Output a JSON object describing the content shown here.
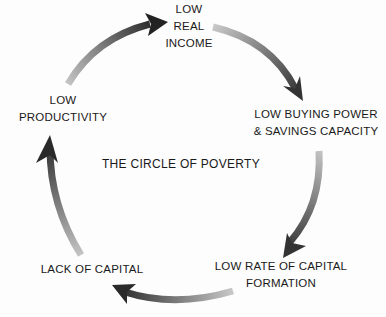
{
  "diagram": {
    "title": "THE CIRCLE OF POVERTY",
    "type": "cycle",
    "colors": {
      "arrow_dark": "#2a2a2a",
      "arrow_light": "#b8b8b8",
      "text": "#1a1a1a"
    },
    "nodes": [
      {
        "id": "income",
        "lines": [
          "LOW",
          "REAL",
          "INCOME"
        ]
      },
      {
        "id": "buying",
        "lines": [
          "LOW BUYING POWER",
          "& SAVINGS CAPACITY"
        ]
      },
      {
        "id": "formation",
        "lines": [
          "LOW RATE OF CAPITAL",
          "FORMATION"
        ]
      },
      {
        "id": "capital",
        "lines": [
          "LACK OF CAPITAL"
        ]
      },
      {
        "id": "productivity",
        "lines": [
          "LOW",
          "PRODUCTIVITY"
        ]
      }
    ],
    "edges": [
      {
        "from": "productivity",
        "to": "income"
      },
      {
        "from": "income",
        "to": "buying"
      },
      {
        "from": "buying",
        "to": "formation"
      },
      {
        "from": "formation",
        "to": "capital"
      },
      {
        "from": "capital",
        "to": "productivity"
      }
    ]
  }
}
